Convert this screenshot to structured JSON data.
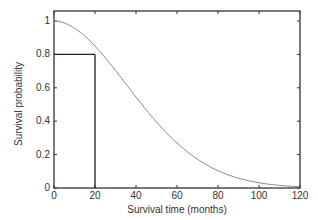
{
  "chart_data": {
    "type": "line",
    "title": "",
    "xlabel": "Survival time (months)",
    "ylabel": "Survival probability",
    "xlim": [
      0,
      120
    ],
    "ylim": [
      0,
      1.05
    ],
    "x_ticks": [
      0,
      20,
      40,
      60,
      80,
      100,
      120
    ],
    "y_ticks": [
      0,
      0.2,
      0.4,
      0.6,
      0.8,
      1
    ],
    "y_tick_labels": [
      "0",
      "0.2",
      "0.4",
      "0.6",
      "0.8",
      "1"
    ],
    "grid": false,
    "series": [
      {
        "name": "Survival curve",
        "x": [
          0,
          10,
          20,
          30,
          40,
          50,
          60,
          70,
          80,
          90,
          100,
          110,
          120
        ],
        "y": [
          1.0,
          0.95,
          0.8,
          0.63,
          0.48,
          0.36,
          0.27,
          0.2,
          0.15,
          0.11,
          0.08,
          0.06,
          0.05
        ]
      }
    ],
    "annotations": [
      {
        "type": "reference-lines",
        "x": 20,
        "y": 0.8,
        "description": "Lines from axes to curve at 20 months, survival 0.8"
      }
    ]
  }
}
